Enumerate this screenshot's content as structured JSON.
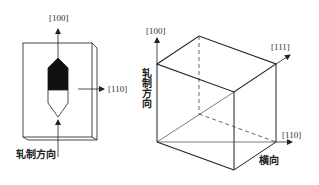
{
  "left_figure": {
    "labels": {
      "dir_100": "[100]",
      "dir_110": "[110]",
      "rolling_direction": "轧制方向"
    },
    "description": "Plate with grain-oriented crystal marker (black upper half, white lower half)"
  },
  "right_figure": {
    "labels": {
      "dir_100": "[100]",
      "dir_111": "[111]",
      "dir_110": "[110]",
      "rolling_direction": "轧制方向",
      "transverse_direction": "横向"
    },
    "description": "Cubic unit cell showing [100], [110], [111] directions relative to rolling and transverse directions"
  },
  "colors": {
    "line": "#222222",
    "fill_dark": "#111111",
    "background": "#ffffff"
  }
}
